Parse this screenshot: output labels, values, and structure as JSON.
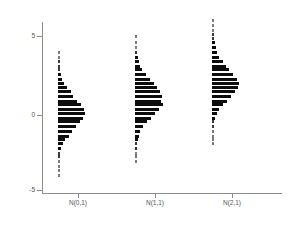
{
  "chart_data": {
    "type": "bar",
    "orientation": "horizontal-stacked-groups",
    "title": "",
    "subtitle": "",
    "xlabel": "",
    "ylabel": "",
    "grid": false,
    "legend": "none",
    "ylim": [
      -5.8,
      6.2
    ],
    "yticks": [
      5,
      0,
      -5
    ],
    "ytick_labels": [
      "5",
      "0",
      "-5"
    ],
    "categories": [
      "N(0,1)",
      "N(1,1)",
      "N(2,1)"
    ],
    "series": [
      {
        "name": "N(0,1)",
        "mean": 0,
        "sd": 1,
        "bins": [
          4.0,
          3.7,
          3.4,
          3.1,
          2.9,
          2.6,
          2.3,
          2.0,
          1.8,
          1.5,
          1.2,
          0.9,
          0.7,
          0.4,
          0.1,
          -0.2,
          -0.4,
          -0.7,
          -1.0,
          -1.3,
          -1.5,
          -1.8,
          -2.1,
          -2.4,
          -2.6,
          -2.9,
          -3.2,
          -3.5,
          -3.8
        ],
        "counts": [
          1,
          1,
          2,
          2,
          2,
          3,
          4,
          6,
          9,
          12,
          14,
          18,
          22,
          25,
          26,
          24,
          21,
          17,
          13,
          10,
          7,
          5,
          3,
          2,
          2,
          1,
          1,
          1,
          1
        ]
      },
      {
        "name": "N(1,1)",
        "mean": 1,
        "sd": 1,
        "bins": [
          5.0,
          4.6,
          4.3,
          4.0,
          3.7,
          3.4,
          3.1,
          2.9,
          2.6,
          2.3,
          2.0,
          1.8,
          1.5,
          1.2,
          0.9,
          0.7,
          0.4,
          0.1,
          -0.2,
          -0.4,
          -0.7,
          -1.0,
          -1.3,
          -1.5,
          -1.8,
          -2.1,
          -2.4,
          -2.6,
          -2.9
        ],
        "counts": [
          1,
          1,
          1,
          2,
          3,
          4,
          5,
          7,
          10,
          14,
          18,
          21,
          24,
          26,
          25,
          27,
          23,
          19,
          15,
          11,
          8,
          5,
          4,
          3,
          2,
          2,
          1,
          1,
          1
        ]
      },
      {
        "name": "N(2,1)",
        "mean": 2,
        "sd": 1,
        "bins": [
          6.0,
          5.7,
          5.4,
          5.1,
          4.9,
          4.6,
          4.3,
          4.0,
          3.7,
          3.4,
          3.1,
          2.9,
          2.6,
          2.3,
          2.0,
          1.8,
          1.5,
          1.2,
          0.9,
          0.7,
          0.4,
          0.1,
          -0.2,
          -0.4,
          -0.7,
          -1.0,
          -1.3,
          -1.5,
          -1.8
        ],
        "counts": [
          1,
          1,
          1,
          2,
          2,
          3,
          4,
          5,
          7,
          10,
          13,
          16,
          20,
          24,
          26,
          25,
          22,
          18,
          14,
          10,
          7,
          5,
          3,
          2,
          2,
          1,
          1,
          1,
          1
        ]
      }
    ]
  },
  "axes": {
    "y_labels": [
      "5",
      "0",
      "-5"
    ],
    "x_labels": [
      "N(0,1)",
      "N(1,1)",
      "N(2,1)"
    ]
  }
}
